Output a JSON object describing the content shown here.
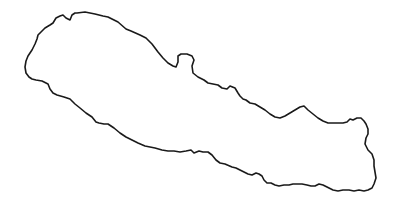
{
  "map": {
    "subject": "Nepal country outline",
    "background": "#ffffff",
    "stroke_color": "#1a1a1a",
    "outline_points": [
      [
        77,
        13
      ],
      [
        85,
        12
      ],
      [
        95,
        14
      ],
      [
        103,
        16
      ],
      [
        108,
        17
      ],
      [
        118,
        22
      ],
      [
        126,
        29
      ],
      [
        131,
        31
      ],
      [
        140,
        35
      ],
      [
        146,
        38
      ],
      [
        152,
        44
      ],
      [
        158,
        52
      ],
      [
        163,
        58
      ],
      [
        168,
        63
      ],
      [
        173,
        66
      ],
      [
        176,
        67
      ],
      [
        178,
        62
      ],
      [
        178,
        56
      ],
      [
        181,
        54
      ],
      [
        187,
        54
      ],
      [
        192,
        56
      ],
      [
        194,
        60
      ],
      [
        192,
        66
      ],
      [
        193,
        73
      ],
      [
        198,
        77
      ],
      [
        204,
        80
      ],
      [
        208,
        83
      ],
      [
        213,
        84
      ],
      [
        218,
        85
      ],
      [
        222,
        88
      ],
      [
        227,
        89
      ],
      [
        230,
        86
      ],
      [
        235,
        88
      ],
      [
        238,
        93
      ],
      [
        240,
        96
      ],
      [
        243,
        99
      ],
      [
        246,
        100
      ],
      [
        250,
        103
      ],
      [
        255,
        104
      ],
      [
        260,
        107
      ],
      [
        265,
        110
      ],
      [
        270,
        114
      ],
      [
        275,
        117
      ],
      [
        280,
        118
      ],
      [
        285,
        116
      ],
      [
        290,
        113
      ],
      [
        295,
        110
      ],
      [
        300,
        107
      ],
      [
        304,
        106
      ],
      [
        308,
        110
      ],
      [
        313,
        114
      ],
      [
        318,
        118
      ],
      [
        323,
        121
      ],
      [
        328,
        123
      ],
      [
        333,
        123
      ],
      [
        338,
        123
      ],
      [
        343,
        123
      ],
      [
        347,
        122
      ],
      [
        350,
        119
      ],
      [
        353,
        120
      ],
      [
        357,
        118
      ],
      [
        361,
        118
      ],
      [
        364,
        121
      ],
      [
        366,
        124
      ],
      [
        368,
        129
      ],
      [
        368,
        134
      ],
      [
        366,
        138
      ],
      [
        365,
        144
      ],
      [
        368,
        150
      ],
      [
        372,
        154
      ],
      [
        374,
        160
      ],
      [
        374,
        166
      ],
      [
        375,
        172
      ],
      [
        376,
        178
      ],
      [
        374,
        184
      ],
      [
        372,
        188
      ],
      [
        368,
        190
      ],
      [
        364,
        191
      ],
      [
        359,
        190
      ],
      [
        354,
        191
      ],
      [
        349,
        190
      ],
      [
        343,
        190
      ],
      [
        338,
        191
      ],
      [
        333,
        190
      ],
      [
        327,
        187
      ],
      [
        323,
        185
      ],
      [
        319,
        184
      ],
      [
        315,
        186
      ],
      [
        311,
        186
      ],
      [
        307,
        185
      ],
      [
        302,
        184
      ],
      [
        297,
        184
      ],
      [
        293,
        184
      ],
      [
        289,
        185
      ],
      [
        284,
        185
      ],
      [
        279,
        186
      ],
      [
        275,
        185
      ],
      [
        271,
        183
      ],
      [
        267,
        183
      ],
      [
        264,
        180
      ],
      [
        262,
        176
      ],
      [
        259,
        174
      ],
      [
        256,
        173
      ],
      [
        252,
        175
      ],
      [
        248,
        174
      ],
      [
        244,
        172
      ],
      [
        240,
        170
      ],
      [
        236,
        168
      ],
      [
        232,
        167
      ],
      [
        225,
        164
      ],
      [
        220,
        163
      ],
      [
        216,
        160
      ],
      [
        212,
        155
      ],
      [
        208,
        152
      ],
      [
        203,
        152
      ],
      [
        199,
        151
      ],
      [
        194,
        153
      ],
      [
        191,
        150
      ],
      [
        186,
        151
      ],
      [
        180,
        152
      ],
      [
        174,
        151
      ],
      [
        168,
        151
      ],
      [
        162,
        150
      ],
      [
        155,
        148
      ],
      [
        150,
        147
      ],
      [
        145,
        146
      ],
      [
        138,
        143
      ],
      [
        132,
        140
      ],
      [
        126,
        137
      ],
      [
        120,
        133
      ],
      [
        114,
        128
      ],
      [
        108,
        124
      ],
      [
        104,
        124
      ],
      [
        99,
        123
      ],
      [
        96,
        122
      ],
      [
        92,
        117
      ],
      [
        86,
        113
      ],
      [
        80,
        108
      ],
      [
        75,
        104
      ],
      [
        70,
        99
      ],
      [
        64,
        97
      ],
      [
        57,
        95
      ],
      [
        53,
        93
      ],
      [
        50,
        89
      ],
      [
        48,
        84
      ],
      [
        42,
        81
      ],
      [
        36,
        80
      ],
      [
        32,
        79
      ],
      [
        29,
        77
      ],
      [
        26,
        73
      ],
      [
        25,
        67
      ],
      [
        26,
        61
      ],
      [
        28,
        56
      ],
      [
        32,
        50
      ],
      [
        35,
        44
      ],
      [
        37,
        39
      ],
      [
        38,
        35
      ],
      [
        41,
        32
      ],
      [
        45,
        28
      ],
      [
        50,
        25
      ],
      [
        53,
        23
      ],
      [
        56,
        18
      ],
      [
        60,
        16
      ],
      [
        63,
        15
      ],
      [
        66,
        18
      ],
      [
        70,
        20
      ],
      [
        72,
        15
      ],
      [
        75,
        13
      ],
      [
        77,
        13
      ]
    ]
  }
}
